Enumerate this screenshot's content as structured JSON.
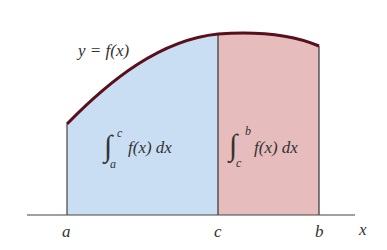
{
  "diagram": {
    "curve_label": "y = f(x)",
    "left_integral": {
      "lower": "a",
      "upper": "c",
      "integrand": "f(x) dx"
    },
    "right_integral": {
      "lower": "c",
      "upper": "b",
      "integrand": "f(x) dx"
    },
    "axis_labels": {
      "a": "a",
      "c": "c",
      "b": "b",
      "x": "x"
    },
    "colors": {
      "left_region": "#c9def3",
      "right_region": "#e6bcbc",
      "curve": "#5a0f1c",
      "axis": "#444444"
    }
  }
}
